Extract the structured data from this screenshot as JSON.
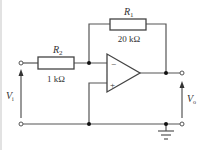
{
  "diagram": {
    "type": "circuit-schematic",
    "components": {
      "r1": {
        "name": "R",
        "sub": "1",
        "value": "20 kΩ"
      },
      "r2": {
        "name": "R",
        "sub": "2",
        "value": "1 kΩ"
      },
      "opamp": {
        "inverting_sign": "−",
        "noninverting_sign": "+"
      }
    },
    "labels": {
      "vin": {
        "name": "V",
        "sub": "i"
      },
      "vout": {
        "name": "V",
        "sub": "o"
      }
    },
    "colors": {
      "wire": "#555555",
      "node": "#111111",
      "text": "#333333",
      "background": "#ffffff"
    }
  }
}
